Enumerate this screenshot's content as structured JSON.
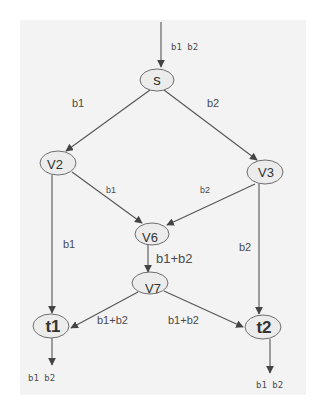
{
  "diagram": {
    "type": "directed-flow-graph",
    "nodes": [
      {
        "id": "s",
        "label": "s",
        "cx": 157,
        "cy": 80,
        "rx": 17,
        "ry": 11,
        "size": 15
      },
      {
        "id": "v2",
        "label": "V2",
        "cx": 59,
        "cy": 163,
        "rx": 18,
        "ry": 12,
        "size": 13
      },
      {
        "id": "v3",
        "label": "V3",
        "cx": 265,
        "cy": 172,
        "rx": 18,
        "ry": 12,
        "size": 13
      },
      {
        "id": "v6",
        "label": "V6",
        "cx": 152,
        "cy": 234,
        "rx": 17,
        "ry": 11,
        "size": 13
      },
      {
        "id": "v7",
        "label": "V7",
        "cx": 150,
        "cy": 284,
        "rx": 18,
        "ry": 11,
        "size": 13
      },
      {
        "id": "t1",
        "label": "t1",
        "cx": 52,
        "cy": 326,
        "rx": 18,
        "ry": 12,
        "size": 17
      },
      {
        "id": "t2",
        "label": "t2",
        "cx": 263,
        "cy": 327,
        "rx": 18,
        "ry": 12,
        "size": 17
      }
    ],
    "edges": [
      {
        "from": "input",
        "to": "s",
        "label": "b1 b2"
      },
      {
        "from": "s",
        "to": "v2",
        "label": "b1"
      },
      {
        "from": "s",
        "to": "v3",
        "label": "b2"
      },
      {
        "from": "v2",
        "to": "v6",
        "label": "b1"
      },
      {
        "from": "v3",
        "to": "v6",
        "label": "b2"
      },
      {
        "from": "v2",
        "to": "t1",
        "label": "b1"
      },
      {
        "from": "v3",
        "to": "t2",
        "label": "b2"
      },
      {
        "from": "v6",
        "to": "v7",
        "label": "b1+b2"
      },
      {
        "from": "v7",
        "to": "t1",
        "label": "b1+b2"
      },
      {
        "from": "v7",
        "to": "t2",
        "label": "b1+b2"
      },
      {
        "from": "t1",
        "to": "output",
        "label": "b1 b2"
      },
      {
        "from": "t2",
        "to": "output",
        "label": "b1 b2"
      }
    ]
  },
  "labels": {
    "node_s": "s",
    "node_v2": "V2",
    "node_v3": "V3",
    "node_v6": "V6",
    "node_v7": "V7",
    "node_t1": "t1",
    "node_t2": "t2",
    "edge_in_s": "b1 b2",
    "edge_s_v2": "b1",
    "edge_s_v3": "b2",
    "edge_v2_v6": "b1",
    "edge_v3_v6": "b2",
    "edge_v2_t1": "b1",
    "edge_v3_t2": "b2",
    "edge_v6_v7": "b1+b2",
    "edge_v7_t1": "b1+b2",
    "edge_v7_t2": "b1+b2",
    "edge_t1_out": "b1 b2",
    "edge_t2_out": "b1 b2"
  },
  "colors": {
    "background": "#ffffff",
    "panel": "#f3f3f3",
    "edge": "#555555",
    "node_fill": "#ececec",
    "node_stroke": "#6e6e6e",
    "text": "#333333"
  }
}
